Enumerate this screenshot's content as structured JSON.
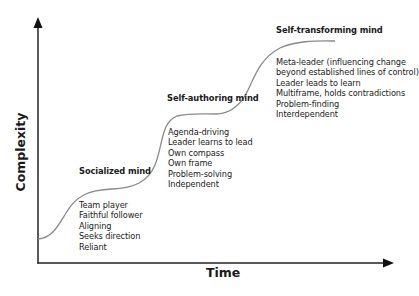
{
  "diagram": {
    "type": "staged-s-curve",
    "axes": {
      "x_label": "Time",
      "y_label": "Complexity"
    },
    "colors": {
      "axis": "#222222",
      "curve": "#8a8a8a",
      "text": "#1a1a1a"
    },
    "stages": [
      {
        "title": "Socialized mind",
        "traits": [
          "Team player",
          "Faithful follower",
          "Aligning",
          "Seeks direction",
          "Reliant"
        ]
      },
      {
        "title": "Self-authoring mind",
        "traits": [
          "Agenda-driving",
          "Leader learns to lead",
          "Own compass",
          "Own frame",
          "Problem-solving",
          "Independent"
        ]
      },
      {
        "title": "Self-transforming mind",
        "traits": [
          "Meta-leader (influencing change",
          "beyond established lines of control)",
          "Leader leads to learn",
          "Multiframe, holds contradictions",
          "Problem-finding",
          "Interdependent"
        ]
      }
    ]
  }
}
